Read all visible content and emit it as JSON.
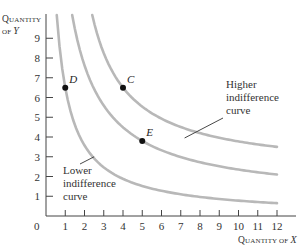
{
  "chart_data": {
    "type": "line",
    "title": "",
    "xlabel": "Quantity of X",
    "ylabel": "Quantity of Y",
    "xlim": [
      0,
      12
    ],
    "ylim": [
      0,
      10
    ],
    "x_ticks": [
      1,
      2,
      3,
      4,
      5,
      6,
      7,
      8,
      9,
      10,
      11,
      12
    ],
    "y_ticks": [
      1,
      2,
      3,
      4,
      5,
      6,
      7,
      8,
      9
    ],
    "origin_label": "0",
    "grid": false,
    "legend": "none",
    "series": [
      {
        "name": "Lower indifference curve",
        "color": "#b8b8b8",
        "form": "y = a/(x-b)+c",
        "a": 7.94,
        "b": -0.222,
        "c": 0.0
      },
      {
        "name": "Middle indifference curve",
        "color": "#b8b8b8",
        "form": "y = a/(x-b)+c",
        "a": 16.06,
        "b": -0.353,
        "c": 0.8
      },
      {
        "name": "Higher indifference curve",
        "color": "#b8b8b8",
        "form": "y = a/(x-b)+c",
        "a": 14.91,
        "b": 0.533,
        "c": 2.2
      }
    ],
    "points": [
      {
        "label": "D",
        "x": 1,
        "y": 6.5
      },
      {
        "label": "C",
        "x": 4,
        "y": 6.5
      },
      {
        "label": "E",
        "x": 5,
        "y": 3.8
      }
    ],
    "annotations": [
      {
        "text": [
          "Higher",
          "indifference",
          "curve"
        ],
        "target_series": "Higher indifference curve",
        "arrow_to": {
          "x": 7.2,
          "y": 3.95
        }
      },
      {
        "text": [
          "Lower",
          "indifference",
          "curve"
        ],
        "target_series": "Lower indifference curve",
        "arrow_to": {
          "x": 2.5,
          "y": 3.0
        }
      }
    ]
  },
  "axis_titles": {
    "y_line1_big": "Q",
    "y_line1_small": "UANTITY",
    "y_line2_small": "OF ",
    "y_line2_var": "Y",
    "x_big": "Q",
    "x_small": "UANTITY OF ",
    "x_var": "X"
  }
}
